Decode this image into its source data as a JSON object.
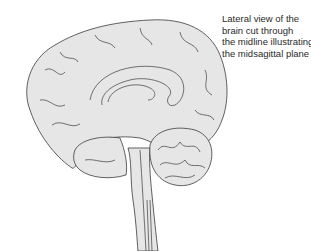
{
  "figure": {
    "caption_lines": [
      "Lateral view of the",
      "brain cut through",
      "the midline illustrating",
      "the midsagittal plane"
    ],
    "colors": {
      "fill": "#e6e6e6",
      "stroke": "#3a3a3a",
      "background": "#ffffff",
      "text": "#2a2a2a"
    }
  }
}
